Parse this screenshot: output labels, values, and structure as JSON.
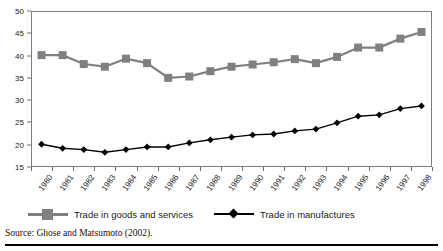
{
  "chart_data": {
    "type": "line",
    "title": "",
    "subtitle": "",
    "xlabel": "",
    "ylabel": "",
    "categories": [
      "1980",
      "1981",
      "1982",
      "1983",
      "1984",
      "1985",
      "1986",
      "1987",
      "1988",
      "1989",
      "1990",
      "1991",
      "1992",
      "1993",
      "1994",
      "1995",
      "1996",
      "1997",
      "1998"
    ],
    "x": [
      1980,
      1981,
      1982,
      1983,
      1984,
      1985,
      1986,
      1987,
      1988,
      1989,
      1990,
      1991,
      1992,
      1993,
      1994,
      1995,
      1996,
      1997,
      1998
    ],
    "series": [
      {
        "name": "Trade in goods and services",
        "color": "#808080",
        "marker": "square",
        "values": [
          40.1,
          40.1,
          38.1,
          37.5,
          39.3,
          38.3,
          35.0,
          35.3,
          36.5,
          37.5,
          38.0,
          38.5,
          39.2,
          38.3,
          39.7,
          41.8,
          41.8,
          43.8,
          45.3
        ]
      },
      {
        "name": "Trade in manufactures",
        "color": "#000000",
        "marker": "diamond",
        "values": [
          20.1,
          19.2,
          18.9,
          18.3,
          18.9,
          19.5,
          19.5,
          20.4,
          21.1,
          21.7,
          22.2,
          22.4,
          23.1,
          23.5,
          24.9,
          26.4,
          26.7,
          28.1,
          28.7
        ]
      }
    ],
    "ylim": [
      15,
      50
    ],
    "yticks": [
      15,
      20,
      25,
      30,
      35,
      40,
      45,
      50
    ],
    "ytick_labels": [
      "15",
      "20",
      "25",
      "30",
      "35",
      "40",
      "45",
      "50"
    ],
    "grid": false,
    "legend_position": "bottom"
  },
  "legend": {
    "entries": [
      {
        "label": "Trade in goods and services"
      },
      {
        "label": "Trade in manufactures"
      }
    ]
  },
  "source": {
    "text": "Source: Ghose and Matsumoto (2002)."
  },
  "colors": {
    "goods_series": "#808080",
    "manufactures_series": "#000000",
    "axis": "#7d7d7d",
    "text": "#1a1a1a",
    "background": "#ffffff"
  }
}
